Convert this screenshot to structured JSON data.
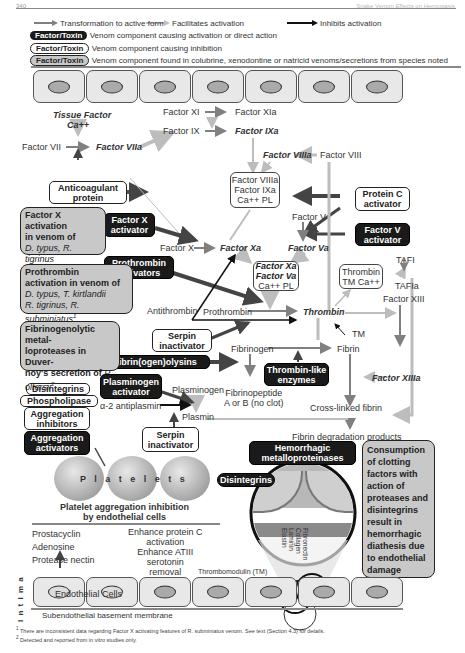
{
  "page": {
    "number": "340",
    "running_head": "Snake Venom Effects on Hemostasis"
  },
  "legend": {
    "arrows": [
      {
        "label": "Transformation to active form",
        "style": "dark-gray"
      },
      {
        "label": "Facilitates activation",
        "style": "light-gray"
      },
      {
        "label": "Inhibits activation",
        "style": "black"
      }
    ],
    "boxes": [
      {
        "pill": "Factor/Toxin",
        "style": "black",
        "label": "Venom component causing activation or direct action"
      },
      {
        "pill": "Factor/Toxin",
        "style": "white",
        "label": "Venom component causing inhibition"
      },
      {
        "pill": "Factor/Toxin",
        "style": "gray",
        "label": "Venom component found in colubrine, xenodontine or natricid venoms/secretions from species noted"
      }
    ]
  },
  "factors": {
    "tissue_factor": "Tissue Factor",
    "ca": "Ca++",
    "f7": "Factor VII",
    "f7a": "Factor VIIa",
    "f11": "Factor XI",
    "f11a": "Factor XIa",
    "f9": "Factor IX",
    "f9a": "Factor IXa",
    "f8": "Factor VIII",
    "f8a": "Factor VIIIa",
    "tenase": [
      "Factor VIIIa",
      "Factor IXa",
      "Ca++   PL"
    ],
    "f5": "Factor V",
    "f5a": "Factor Va",
    "f10": "Factor X",
    "f10a": "Factor Xa",
    "prothrombinase": [
      "Factor Xa",
      "Factor Va",
      "Ca++  PL"
    ],
    "antithrombin": "Antithrombin",
    "prothrombin": "Prothrombin",
    "thrombin": "Thrombin",
    "thrombin_tm": [
      "Thrombin",
      "TM Ca++"
    ],
    "tafi": "TAFI",
    "tafia": "TAFIa",
    "f13": "Factor XIII",
    "f13a": "Factor XIIIa",
    "tm": "TM",
    "fibrinogen": "Fibrinogen",
    "fibrin": "Fibrin",
    "fibrinopeptide": [
      "Fibrinopeptide",
      "A or B (no clot)"
    ],
    "crosslinked": "Cross-linked fibrin",
    "fdp": "Fibrin degradation products",
    "plasminogen": "Plasminogen",
    "plasmin": "Plasmin",
    "a2ap": "α-2 antiplasmin"
  },
  "venom_boxes": {
    "anticoagulant": [
      "Anticoagulant",
      "protein"
    ],
    "protein_c_act": [
      "Protein C",
      "activator"
    ],
    "factor_v_act": [
      "Factor V",
      "activator"
    ],
    "factor_x_act": [
      "Factor X",
      "activator"
    ],
    "prothrombin_act": [
      "Prothrombin",
      "activators"
    ],
    "serpin1": [
      "Serpin",
      "inactivator"
    ],
    "fibrinogenolysins": "Fibrin(ogen)olysins",
    "thrombin_like": [
      "Thrombin-like",
      "enzymes"
    ],
    "plasminogen_act": [
      "Plasminogen",
      "activator"
    ],
    "serpin2": [
      "Serpin",
      "inactivator"
    ],
    "disintegrins": "Disintegrins",
    "phospholipase": "Phospholipase",
    "agg_inhibitors": [
      "Aggregation",
      "inhibitors"
    ],
    "agg_activators": [
      "Aggregation",
      "activators"
    ],
    "hemorrhagic_mp": [
      "Hemorrhagic",
      "metalloproteinases"
    ],
    "disintegrins2": "Disintegrins"
  },
  "gray_boxes": {
    "fx_activation": {
      "title": [
        "Factor X activation",
        "in venom of"
      ],
      "species": [
        "D. typus, R. tigrinus",
        "R. subminiatus"
      ],
      "sup": "1"
    },
    "prothrombin_activation": {
      "title": [
        "Prothrombin",
        "activation in venom of"
      ],
      "species": [
        "D. typus, T. kirtlandii",
        "R. tigrinus, R. subminiatus"
      ],
      "sup": "1"
    },
    "fibrinogenolytic": {
      "title": [
        "Fibrinogenolytic metal-",
        "loproteases in Duver-",
        "noy's secretion of "
      ],
      "species": [
        "P.",
        "olfersii"
      ],
      "sup": "2"
    },
    "consumption": [
      "Consumption",
      "of clotting",
      "factors with",
      "action of",
      "proteases and",
      "disintegrins",
      "result in",
      "hemorrhagic",
      "diathesis due",
      "to endothelial",
      "damage"
    ]
  },
  "platelets": {
    "label": "P l a t e l e t s",
    "inhibition_title": [
      "Platelet aggregation inhibition",
      "by endothelial cells"
    ],
    "left_list": [
      "Prostacyclin",
      "Adenosine",
      "Protease nectin"
    ],
    "right_list": [
      "Enhance protein C",
      "activation",
      "Enhance ATIII",
      "serotonin",
      "removal"
    ]
  },
  "vessel": {
    "thrombomodulin": "Thrombomodulin (TM)",
    "endothelial": "Endothelial Cells",
    "intima": "I n t i m a",
    "basement": "Subendothelial basement membrane",
    "matrix": [
      "Fibronectin",
      "Collagen",
      "Laminin",
      "Elastin"
    ]
  },
  "footnotes": [
    {
      "sup": "1",
      "text": "There are inconsistent data regarding Factor X activating features of R. subminiatus venom. See text (Section 4.3) for details."
    },
    {
      "sup": "2",
      "text": "Detected and reported from in vitro studies only."
    }
  ],
  "colors": {
    "black_box": "#1a1a1a",
    "gray_box": "#c8c8c8",
    "transform_arrow": "#808080",
    "facilitate_arrow": "#c0c0c0",
    "inhibit_arrow": "#111111",
    "cell": "#e8e8e8"
  }
}
